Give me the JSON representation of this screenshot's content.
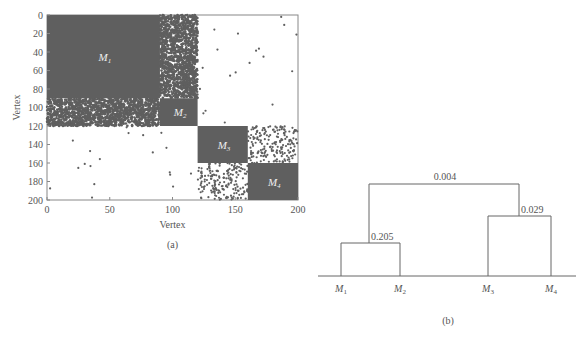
{
  "chart_data": [
    {
      "type": "heatmap",
      "panel_label": "(a)",
      "xlabel": "Vertex",
      "ylabel": "Vertex",
      "xlim": [
        0,
        200
      ],
      "ylim": [
        0,
        200
      ],
      "x_ticks": [
        "0",
        "50",
        "100",
        "150",
        "200"
      ],
      "y_ticks": [
        "0",
        "20",
        "40",
        "60",
        "80",
        "100",
        "120",
        "140",
        "160",
        "180",
        "200"
      ],
      "blocks": [
        {
          "name": "M1",
          "sub": "1",
          "start": 0,
          "end": 90
        },
        {
          "name": "M2",
          "sub": "2",
          "start": 90,
          "end": 120
        },
        {
          "name": "M3",
          "sub": "3",
          "start": 120,
          "end": 160
        },
        {
          "name": "M4",
          "sub": "4",
          "start": 160,
          "end": 200
        }
      ],
      "dense_offdiagonal": [
        {
          "rows": [
            0,
            90
          ],
          "cols": [
            90,
            120
          ],
          "density": 0.5
        },
        {
          "rows": [
            90,
            120
          ],
          "cols": [
            0,
            90
          ],
          "density": 0.5
        }
      ],
      "medium_offdiagonal": [
        {
          "rows": [
            120,
            160
          ],
          "cols": [
            160,
            200
          ],
          "density": 0.12
        },
        {
          "rows": [
            160,
            200
          ],
          "cols": [
            120,
            160
          ],
          "density": 0.12
        }
      ],
      "color": "#5f5f5f"
    },
    {
      "type": "dendrogram",
      "panel_label": "(b)",
      "leaves": [
        {
          "name": "M",
          "sub": "1"
        },
        {
          "name": "M",
          "sub": "2"
        },
        {
          "name": "M",
          "sub": "3"
        },
        {
          "name": "M",
          "sub": "4"
        }
      ],
      "merges": [
        {
          "left": "M1",
          "right": "M2",
          "value": "0.205"
        },
        {
          "left": "M3",
          "right": "M4",
          "value": "0.029"
        },
        {
          "left": "M1M2",
          "right": "M3M4",
          "value": "0.004"
        }
      ]
    }
  ]
}
